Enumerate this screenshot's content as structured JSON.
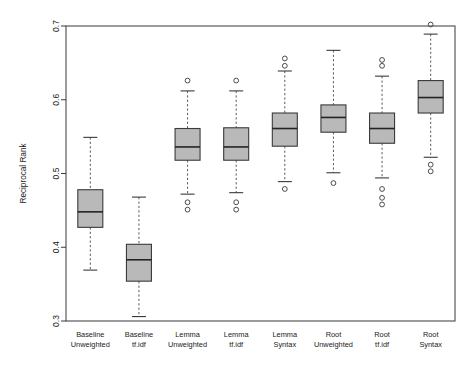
{
  "chart_data": {
    "type": "box",
    "title": "",
    "xlabel": "",
    "ylabel": "Reciprocal Rank",
    "ylim": [
      0.3,
      0.7
    ],
    "yticks": [
      0.3,
      0.4,
      0.5,
      0.6,
      0.7
    ],
    "ytick_labels": [
      "0.3",
      "0.4",
      "0.5",
      "0.6",
      "0.7"
    ],
    "grid": false,
    "legend": "none",
    "box_fill_color": "#b9b9b9",
    "line_color": "#3a3a3a",
    "categories": [
      "Baseline\nUnweighted",
      "Baseline\ntf.idf",
      "Lemma\nUnweighted",
      "Lemma\ntf.idf",
      "Lemma\nSyntax",
      "Root\nUnweighted",
      "Root\ntf.idf",
      "Root\nSyntax"
    ],
    "category_lines": [
      [
        "Baseline",
        "Unweighted"
      ],
      [
        "Baseline",
        "tf.idf"
      ],
      [
        "Lemma",
        "Unweighted"
      ],
      [
        "Lemma",
        "tf.idf"
      ],
      [
        "Lemma",
        "Syntax"
      ],
      [
        "Root",
        "Unweighted"
      ],
      [
        "Root",
        "tf.idf"
      ],
      [
        "Root",
        "Syntax"
      ]
    ],
    "boxes": [
      {
        "category": "Baseline Unweighted",
        "whisker_low": 0.369,
        "q1": 0.427,
        "median": 0.448,
        "q3": 0.478,
        "whisker_high": 0.549,
        "outliers": []
      },
      {
        "category": "Baseline tf.idf",
        "whisker_low": 0.306,
        "q1": 0.354,
        "median": 0.383,
        "q3": 0.404,
        "whisker_high": 0.468,
        "outliers": []
      },
      {
        "category": "Lemma Unweighted",
        "whisker_low": 0.472,
        "q1": 0.518,
        "median": 0.536,
        "q3": 0.561,
        "whisker_high": 0.612,
        "outliers": [
          0.626,
          0.461,
          0.451
        ]
      },
      {
        "category": "Lemma tf.idf",
        "whisker_low": 0.474,
        "q1": 0.518,
        "median": 0.536,
        "q3": 0.562,
        "whisker_high": 0.612,
        "outliers": [
          0.626,
          0.461,
          0.451
        ]
      },
      {
        "category": "Lemma Syntax",
        "whisker_low": 0.489,
        "q1": 0.537,
        "median": 0.561,
        "q3": 0.582,
        "whisker_high": 0.639,
        "outliers": [
          0.656,
          0.646,
          0.479
        ]
      },
      {
        "category": "Root Unweighted",
        "whisker_low": 0.501,
        "q1": 0.556,
        "median": 0.576,
        "q3": 0.593,
        "whisker_high": 0.667,
        "outliers": [
          0.487
        ]
      },
      {
        "category": "Root tf.idf",
        "whisker_low": 0.494,
        "q1": 0.541,
        "median": 0.561,
        "q3": 0.582,
        "whisker_high": 0.632,
        "outliers": [
          0.654,
          0.646,
          0.479,
          0.467,
          0.458
        ]
      },
      {
        "category": "Root Syntax",
        "whisker_low": 0.522,
        "q1": 0.582,
        "median": 0.603,
        "q3": 0.626,
        "whisker_high": 0.689,
        "outliers": [
          0.702,
          0.512,
          0.503
        ]
      }
    ]
  }
}
